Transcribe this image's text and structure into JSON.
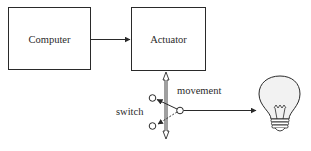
{
  "diagram": {
    "nodes": [
      {
        "id": "computer",
        "label": "Computer",
        "shape": "box"
      },
      {
        "id": "actuator",
        "label": "Actuator",
        "shape": "box"
      },
      {
        "id": "switch",
        "label": "switch",
        "shape": "two-way switch"
      },
      {
        "id": "bulb",
        "label": "",
        "shape": "light-bulb-icon"
      }
    ],
    "edges": [
      {
        "from": "computer",
        "to": "actuator",
        "type": "arrow"
      },
      {
        "from": "actuator",
        "to": "switch",
        "type": "double-arrow",
        "label": "movement"
      },
      {
        "from": "switch",
        "to": "bulb",
        "type": "arrow"
      }
    ],
    "labels": {
      "computer": "Computer",
      "actuator": "Actuator",
      "movement": "movement",
      "switch": "switch"
    },
    "colors": {
      "stroke": "#2a2a2a",
      "bulb_fill": "#f2f2f2",
      "background": "#ffffff"
    }
  }
}
